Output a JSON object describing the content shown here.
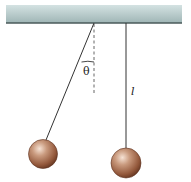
{
  "diagram": {
    "angle_label": "θ",
    "length_label": "l",
    "colors": {
      "ceiling_top": "#c9d9d9",
      "ceiling_bottom": "#9db3b3",
      "ceiling_edge": "#4a5a5a",
      "string": "#333333",
      "ball_light": "#f2d8c8",
      "ball_mid": "#b07a5e",
      "ball_dark": "#6e3f28"
    },
    "elements": [
      {
        "name": "ceiling",
        "type": "support"
      },
      {
        "name": "displaced-pendulum",
        "type": "pendulum",
        "state": "displaced"
      },
      {
        "name": "vertical-reference",
        "type": "dashed-line"
      },
      {
        "name": "rest-pendulum",
        "type": "pendulum",
        "state": "at-rest"
      }
    ]
  }
}
